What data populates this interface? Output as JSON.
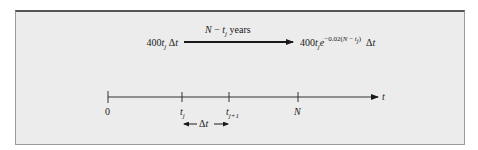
{
  "figure": {
    "type": "timeline-diagram",
    "colors": {
      "panel_bg": "#ececec",
      "panel_top_border": "#555555",
      "ink": "#1a1a1a"
    }
  },
  "top_transition": {
    "left_expr": {
      "coef": "400",
      "var": "t",
      "sub": "j",
      "tail": "Δt"
    },
    "arrow_label": {
      "prefix": "N − ",
      "var": "t",
      "sub": "j",
      "suffix": " years"
    },
    "right_expr": {
      "coef": "400",
      "var": "t",
      "sub": "j",
      "base": "e",
      "exponent": "−0.02(N − t",
      "exp_sub": "j",
      "exp_close": ")",
      "tail": "Δt"
    }
  },
  "timeline": {
    "axis_label": "t",
    "ticks": [
      {
        "label": "0",
        "var": "",
        "sub": ""
      },
      {
        "label": "",
        "var": "t",
        "sub": "j"
      },
      {
        "label": "",
        "var": "t",
        "sub": "j+1"
      },
      {
        "label": "N",
        "var": "",
        "sub": ""
      }
    ],
    "interval_label": "Δt"
  }
}
